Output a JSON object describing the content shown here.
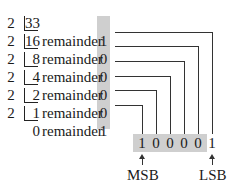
{
  "divisor": "2",
  "label": "remainder",
  "rows": [
    {
      "quotient": "33",
      "remainder": null
    },
    {
      "quotient": "16",
      "remainder": "1"
    },
    {
      "quotient": "8",
      "remainder": "0"
    },
    {
      "quotient": "4",
      "remainder": "0"
    },
    {
      "quotient": "2",
      "remainder": "0"
    },
    {
      "quotient": "1",
      "remainder": "0"
    },
    {
      "quotient": "0",
      "remainder": "1"
    }
  ],
  "result_bits": [
    "1",
    "0",
    "0",
    "0",
    "0",
    "1"
  ],
  "msb_label": "MSB",
  "lsb_label": "LSB",
  "colors": {
    "shade": "#cfcfcf",
    "line": "#333333"
  }
}
